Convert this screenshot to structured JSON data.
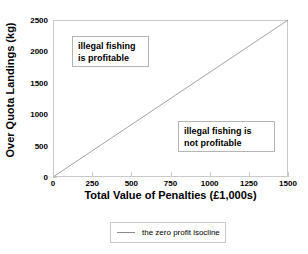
{
  "chart_data": {
    "type": "line",
    "title": "",
    "xlabel": "Total Value of Penalties (£1,000s)",
    "ylabel": "Over Quota Landings (kg)",
    "xlim": [
      0,
      1500
    ],
    "ylim": [
      0,
      2500
    ],
    "xticks": [
      0,
      250,
      500,
      750,
      1000,
      1250,
      1500
    ],
    "yticks": [
      0,
      500,
      1000,
      1500,
      2000,
      2500
    ],
    "xtick_labels": [
      "0",
      "250",
      "500",
      "750",
      "1000",
      "1250",
      "1500"
    ],
    "ytick_labels": [
      "0",
      "500",
      "1000",
      "1500",
      "2000",
      "2500"
    ],
    "grid": false,
    "legend_position": "below-axes",
    "series": [
      {
        "name": "the zero profit isocline",
        "color": "#8c8c8c",
        "x": [
          0,
          1500
        ],
        "values": [
          0,
          2500
        ]
      }
    ],
    "annotations": [
      {
        "id": "profitable",
        "text": "illegal fishing\nis profitable",
        "x": 130,
        "y": 2160
      },
      {
        "id": "not-profitable",
        "text": "illegal fishing is\nnot profitable",
        "x": 800,
        "y": 800
      }
    ]
  },
  "legend": {
    "entries": [
      {
        "label": "the zero profit isocline",
        "color": "#8c8c8c"
      }
    ]
  },
  "colors": {
    "line": "#8c8c8c",
    "frame": "#c9c9c9",
    "text": "#000000",
    "background": "#ffffff"
  }
}
